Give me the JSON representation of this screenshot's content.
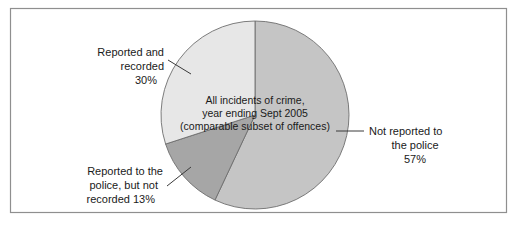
{
  "figure": {
    "background_color": "#ffffff",
    "border_color": "#8f8f8f"
  },
  "center_annotation": {
    "line1": "All incidents of crime,",
    "line2": "year ending Sept 2005",
    "line3": "(comparable subset of offences)"
  },
  "labels": {
    "not_reported": {
      "line1": "Not reported to",
      "line2": "the police",
      "line3": "57%"
    },
    "reported_recorded": {
      "line1": "Reported and",
      "line2": "recorded",
      "line3": "30%"
    },
    "reported_not_recorded": {
      "line1": "Reported to the",
      "line2": "police, but not",
      "line3": "recorded 13%"
    }
  },
  "chart_data": {
    "type": "pie",
    "title": "All incidents of crime, year ending Sept 2005 (comparable subset of offences)",
    "categories": [
      "Not reported to the police",
      "Reported to the police, but not recorded",
      "Reported and recorded"
    ],
    "values": [
      57,
      13,
      30
    ],
    "value_suffix": "%",
    "colors": [
      "#c5c5c5",
      "#a6a6a6",
      "#e7e7e7"
    ],
    "slice_border_color": "#6e6e6e",
    "start_angle_deg": 0,
    "direction": "clockwise",
    "legend": "none",
    "data_labels": [
      "57%",
      "13%",
      "30%"
    ],
    "center_x": 255,
    "center_y": 115,
    "radius": 94
  }
}
